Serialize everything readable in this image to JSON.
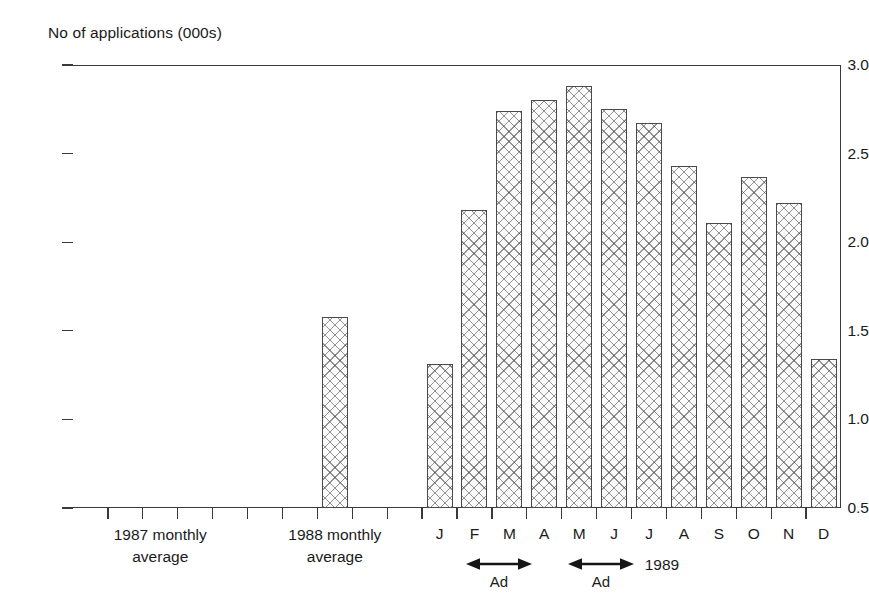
{
  "chart_data": {
    "type": "bar",
    "title": "",
    "ylabel": "No of applications (000s)",
    "xlabel": "",
    "ylim": [
      0.5,
      3.0
    ],
    "ytick_labels": [
      "3.0",
      "2.5",
      "2.0",
      "1.5",
      "1.0",
      "0.5"
    ],
    "ytick_values": [
      3.0,
      2.5,
      2.0,
      1.5,
      1.0,
      0.5
    ],
    "grid": false,
    "legend": null,
    "categories": [
      "1987 monthly average",
      "1988 monthly average",
      "J",
      "F",
      "M",
      "A",
      "M",
      "J",
      "J",
      "A",
      "S",
      "O",
      "N",
      "D"
    ],
    "values": [
      null,
      1.58,
      1.31,
      2.18,
      2.74,
      2.8,
      2.88,
      2.75,
      2.67,
      2.43,
      2.11,
      2.37,
      2.22,
      1.34
    ],
    "series": [
      {
        "name": "No of applications (000s)",
        "values": [
          null,
          1.58,
          1.31,
          2.18,
          2.74,
          2.8,
          2.88,
          2.75,
          2.67,
          2.43,
          2.11,
          2.37,
          2.22,
          1.34
        ]
      }
    ],
    "annotations": [
      {
        "label": "Ad",
        "span": "F-M",
        "type": "double-arrow"
      },
      {
        "label": "Ad",
        "span": "M-J",
        "type": "double-arrow"
      },
      {
        "label": "1989",
        "span": "J-A",
        "type": "group-label"
      }
    ]
  },
  "axis": {
    "y_title": "No of applications (000s)",
    "ticks": [
      {
        "label": "3.0",
        "value": 3.0
      },
      {
        "label": "2.5",
        "value": 2.5
      },
      {
        "label": "2.0",
        "value": 2.0
      },
      {
        "label": "1.5",
        "value": 1.5
      },
      {
        "label": "1.0",
        "value": 1.0
      },
      {
        "label": "0.5",
        "value": 0.5
      }
    ]
  },
  "x_categories": [
    {
      "line1": "1987 monthly",
      "line2": "average"
    },
    {
      "line1": "1988 monthly",
      "line2": "average"
    }
  ],
  "months": [
    "J",
    "F",
    "M",
    "A",
    "M",
    "J",
    "J",
    "A",
    "S",
    "O",
    "N",
    "D"
  ],
  "annotations": {
    "ad1": "Ad",
    "ad2": "Ad",
    "year": "1989"
  },
  "colors": {
    "axis": "#3a3a3a",
    "bar_outline": "#4a4a4a",
    "bar_fill": "#fbfbfb",
    "hatch": "#3c3c3c",
    "text": "#1a1a1a",
    "background": "#ffffff"
  }
}
